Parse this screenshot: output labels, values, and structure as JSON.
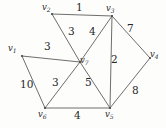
{
  "figure": {
    "type": "weighted-undirected-graph",
    "title": "",
    "background_color": "#fdfdfc",
    "line_color": "#5d5d5d",
    "text_color": "#262626"
  },
  "vertices": [
    {
      "id": "v1",
      "name": "v",
      "subscript": "1",
      "x": 22,
      "y": 56,
      "label_x": 8,
      "label_y": 44
    },
    {
      "id": "v2",
      "name": "v",
      "subscript": "2",
      "x": 52,
      "y": 14,
      "label_x": 42,
      "label_y": 3
    },
    {
      "id": "v3",
      "name": "v",
      "subscript": "3",
      "x": 112,
      "y": 16,
      "label_x": 106,
      "label_y": 4
    },
    {
      "id": "v4",
      "name": "v",
      "subscript": "4",
      "x": 150,
      "y": 58,
      "label_x": 150,
      "label_y": 50
    },
    {
      "id": "v5",
      "name": "v",
      "subscript": "5",
      "x": 110,
      "y": 108,
      "label_x": 105,
      "label_y": 110
    },
    {
      "id": "v6",
      "name": "v",
      "subscript": "6",
      "x": 45,
      "y": 108,
      "label_x": 38,
      "label_y": 110
    },
    {
      "id": "v7",
      "name": "v",
      "subscript": "7",
      "x": 80,
      "y": 62,
      "label_x": 80,
      "label_y": 56
    }
  ],
  "edges": [
    {
      "id": "e-v2-v3",
      "from": "v2",
      "to": "v3",
      "weight": "1",
      "label_x": 76,
      "label_y": 2
    },
    {
      "id": "e-v2-v7",
      "from": "v2",
      "to": "v7",
      "weight": "3",
      "label_x": 68,
      "label_y": 26
    },
    {
      "id": "e-v3-v7",
      "from": "v3",
      "to": "v7",
      "weight": "4",
      "label_x": 89,
      "label_y": 26
    },
    {
      "id": "e-v3-v4",
      "from": "v3",
      "to": "v4",
      "weight": "7",
      "label_x": 127,
      "label_y": 23
    },
    {
      "id": "e-v3-v5",
      "from": "v3",
      "to": "v5",
      "weight": "2",
      "label_x": 111,
      "label_y": 54
    },
    {
      "id": "e-v4-v5",
      "from": "v4",
      "to": "v5",
      "weight": "8",
      "label_x": 132,
      "label_y": 85
    },
    {
      "id": "e-v1-v7",
      "from": "v1",
      "to": "v7",
      "weight": "3",
      "label_x": 44,
      "label_y": 41
    },
    {
      "id": "e-v1-v6",
      "from": "v1",
      "to": "v6",
      "weight": "10",
      "label_x": 20,
      "label_y": 79
    },
    {
      "id": "e-v6-v7",
      "from": "v6",
      "to": "v7",
      "weight": "3",
      "label_x": 52,
      "label_y": 77
    },
    {
      "id": "e-v5-v7",
      "from": "v5",
      "to": "v7",
      "weight": "5",
      "label_x": 85,
      "label_y": 77
    },
    {
      "id": "e-v6-v5",
      "from": "v6",
      "to": "v5",
      "weight": "4",
      "label_x": 74,
      "label_y": 110
    }
  ]
}
